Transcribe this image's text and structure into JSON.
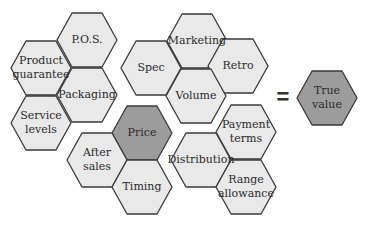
{
  "diagram": {
    "colors": {
      "hex_fill": "#e9e9e9",
      "hex_fill_highlight": "#9c9c9c",
      "hex_stroke": "#3a3a3a",
      "text": "#2a2a2a"
    },
    "hex_geometry": {
      "radius": 30,
      "orientation": "flat-top"
    },
    "equals_symbol": "=",
    "clusters": [
      {
        "name": "left-cluster",
        "hexes": [
          {
            "id": "pos",
            "label": "P.O.S.",
            "cx": 87,
            "cy": 40,
            "highlight": false
          },
          {
            "id": "product-guarantee",
            "label": "Product\nguarantee",
            "cx": 41,
            "cy": 68,
            "highlight": false
          },
          {
            "id": "packaging",
            "label": "Packaging",
            "cx": 87,
            "cy": 95,
            "highlight": false
          },
          {
            "id": "service-levels",
            "label": "Service\nlevels",
            "cx": 41,
            "cy": 123,
            "highlight": false
          }
        ]
      },
      {
        "name": "top-middle-cluster",
        "hexes": [
          {
            "id": "marketing",
            "label": "Marketing",
            "cx": 197,
            "cy": 41,
            "highlight": false
          },
          {
            "id": "spec",
            "label": "Spec",
            "cx": 151,
            "cy": 68,
            "highlight": false
          },
          {
            "id": "retro",
            "label": "Retro",
            "cx": 238,
            "cy": 66,
            "highlight": false
          },
          {
            "id": "volume",
            "label": "Volume",
            "cx": 196,
            "cy": 96,
            "highlight": false
          }
        ]
      },
      {
        "name": "bottom-left-cluster",
        "hexes": [
          {
            "id": "price",
            "label": "Price",
            "cx": 142,
            "cy": 133,
            "highlight": true
          },
          {
            "id": "after-sales",
            "label": "After\nsales",
            "cx": 97,
            "cy": 160,
            "highlight": false
          },
          {
            "id": "timing",
            "label": "Timing",
            "cx": 142,
            "cy": 187,
            "highlight": false
          }
        ]
      },
      {
        "name": "bottom-right-cluster",
        "hexes": [
          {
            "id": "payment-terms",
            "label": "Payment\nterms",
            "cx": 246,
            "cy": 132,
            "highlight": false
          },
          {
            "id": "distribution",
            "label": "Distribution",
            "cx": 201,
            "cy": 160,
            "highlight": false
          },
          {
            "id": "range-allowance",
            "label": "Range\nallowance",
            "cx": 246,
            "cy": 187,
            "highlight": false
          }
        ]
      }
    ],
    "result": {
      "id": "true-value",
      "label": "True\nvalue",
      "cx": 327,
      "cy": 98,
      "highlight": true
    },
    "equals_position": {
      "x": 283,
      "y": 97
    }
  }
}
